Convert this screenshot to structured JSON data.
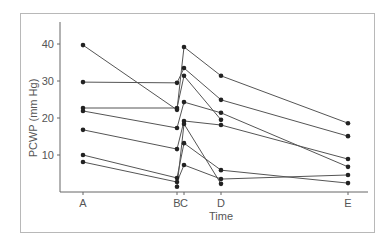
{
  "chart_data": {
    "type": "line",
    "title": "",
    "xlabel": "Time",
    "ylabel": "PCWP (mm Hg)",
    "ylim": [
      0,
      45
    ],
    "yticks": [
      10,
      20,
      30,
      40
    ],
    "categories": [
      "A",
      "B",
      "C",
      "D",
      "E"
    ],
    "category_positions": {
      "A": 0,
      "B": 94,
      "C": 101,
      "D": 138,
      "E": 265
    },
    "grid": false,
    "legend": null,
    "series": [
      {
        "name": "Patient 1",
        "values": [
          39.7,
          22.2,
          39.2,
          31.4,
          18.6
        ]
      },
      {
        "name": "Patient 2",
        "values": [
          29.7,
          29.5,
          33.5,
          24.9,
          15.1
        ]
      },
      {
        "name": "Patient 3",
        "values": [
          22.7,
          22.7,
          31.4,
          19.5,
          null
        ]
      },
      {
        "name": "Patient 4",
        "values": [
          21.9,
          17.3,
          24.3,
          21.4,
          6.8
        ]
      },
      {
        "name": "Patient 5",
        "values": [
          16.8,
          11.6,
          19.2,
          18.1,
          8.9
        ]
      },
      {
        "name": "Patient 6",
        "values": [
          10.0,
          3.8,
          13.2,
          5.9,
          2.4
        ]
      },
      {
        "name": "Patient 7",
        "values": [
          8.1,
          2.7,
          7.3,
          3.5,
          4.6
        ]
      },
      {
        "name": "Patient 8",
        "values": [
          null,
          1.4,
          18.4,
          2.2,
          null
        ]
      }
    ]
  },
  "colors": {
    "line": "#555555",
    "marker": "#222222",
    "axis": "#666666",
    "frame": "#b8b8b8"
  }
}
